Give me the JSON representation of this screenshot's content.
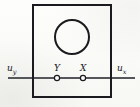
{
  "figure": {
    "kind": "engineering-line-diagram",
    "background_color": "#fbfbf9",
    "ink_color": "#15151a",
    "line_color": "#55565a"
  },
  "diagram": {
    "outer_box": {
      "name": "rectangular-enclosure",
      "x": 33,
      "y": 5,
      "width": 78,
      "height": 92,
      "stroke_width": 2,
      "stroke_color": "#1b1b1f",
      "fill": "none"
    },
    "inner_circle": {
      "name": "circle-element",
      "cx": 72,
      "cy": 37,
      "r": 17,
      "stroke_width": 2,
      "stroke_color": "#1b1b1f",
      "fill": "none"
    },
    "axis_line": {
      "name": "horizontal-axis-line",
      "y": 78,
      "stroke_width": 1.4,
      "stroke_color": "#55565a",
      "segments": [
        {
          "x1": 8,
          "x2": 54
        },
        {
          "x1": 60,
          "x2": 80
        },
        {
          "x1": 86,
          "x2": 135
        }
      ]
    },
    "terminals": [
      {
        "name": "terminal-y",
        "label": "Y",
        "cx": 57,
        "cy": 78,
        "r": 2.6,
        "stroke_width": 1.2,
        "stroke_color": "#1b1b1f",
        "fill": "#fbfbf9"
      },
      {
        "name": "terminal-x",
        "label": "X",
        "cx": 83,
        "cy": 78,
        "r": 2.6,
        "stroke_width": 1.2,
        "stroke_color": "#1b1b1f",
        "fill": "#fbfbf9"
      }
    ]
  },
  "labels": {
    "left_input": {
      "base": "u",
      "subscript": "y"
    },
    "right_input": {
      "base": "u",
      "subscript": "x"
    },
    "terminal_y": "Y",
    "terminal_x": "X"
  }
}
